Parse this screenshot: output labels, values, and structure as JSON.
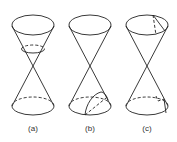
{
  "figure": {
    "panels": [
      {
        "label": "(a)",
        "section": "circle"
      },
      {
        "label": "(b)",
        "section": "ellipse/parabola cut on lower nappe"
      },
      {
        "label": "(c)",
        "section": "hyperbola cutting both nappes"
      }
    ]
  },
  "colors": {
    "line": "#222222",
    "background": "#ffffff"
  }
}
